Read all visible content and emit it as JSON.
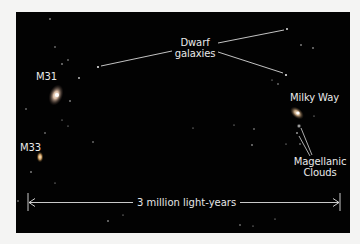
{
  "figure": {
    "background_color": "#020202",
    "label_color": "#e9e9e9",
    "labels": {
      "dwarf_line1": "Dwarf",
      "dwarf_line2": "galaxies",
      "m31": "M31",
      "m33": "M33",
      "milky_way": "Milky Way",
      "magellanic_line1": "Magellanic",
      "magellanic_line2": "Clouds"
    },
    "scale_bar": {
      "label": "3 million light-years"
    }
  }
}
